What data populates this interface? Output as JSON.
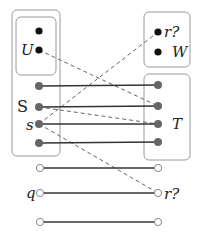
{
  "title": "",
  "colors": {
    "box_stroke": "#9a9a9a",
    "solid_edge": "#333333",
    "dashed_edge": "#666666",
    "black_node": "#111111",
    "gray_node": "#666666",
    "open_node_stroke": "#888888"
  },
  "boxes": [
    {
      "id": "outer-left",
      "x": 12,
      "y": 10,
      "w": 48,
      "h": 146
    },
    {
      "id": "U-box",
      "x": 16,
      "y": 17,
      "w": 40,
      "h": 58
    },
    {
      "id": "top-right",
      "x": 144,
      "y": 12,
      "w": 46,
      "h": 55
    },
    {
      "id": "T-box",
      "x": 144,
      "y": 74,
      "w": 46,
      "h": 86
    }
  ],
  "labels": {
    "U": "U",
    "S": "S",
    "s": "s",
    "T": "T",
    "r_top": "r?",
    "W": "W",
    "q": "q",
    "r_bottom": "r?"
  },
  "nodes": {
    "left": [
      {
        "id": "u1",
        "x": 39,
        "y": 31,
        "type": "black"
      },
      {
        "id": "U",
        "x": 39,
        "y": 50,
        "type": "black"
      },
      {
        "id": "l1",
        "x": 39,
        "y": 86,
        "type": "gray"
      },
      {
        "id": "S",
        "x": 39,
        "y": 107,
        "type": "gray"
      },
      {
        "id": "s",
        "x": 39,
        "y": 124,
        "type": "gray"
      },
      {
        "id": "l4",
        "x": 39,
        "y": 143,
        "type": "gray"
      },
      {
        "id": "o1",
        "x": 40,
        "y": 168,
        "type": "open"
      },
      {
        "id": "q",
        "x": 40,
        "y": 193,
        "type": "open"
      },
      {
        "id": "o3",
        "x": 40,
        "y": 222,
        "type": "open"
      }
    ],
    "right": [
      {
        "id": "r_top",
        "x": 158,
        "y": 32,
        "type": "black"
      },
      {
        "id": "W",
        "x": 158,
        "y": 52,
        "type": "black"
      },
      {
        "id": "t1",
        "x": 158,
        "y": 85,
        "type": "gray"
      },
      {
        "id": "t2",
        "x": 158,
        "y": 106,
        "type": "gray"
      },
      {
        "id": "t3",
        "x": 158,
        "y": 124,
        "type": "gray"
      },
      {
        "id": "t4",
        "x": 158,
        "y": 142,
        "type": "gray"
      },
      {
        "id": "p1",
        "x": 158,
        "y": 168,
        "type": "open"
      },
      {
        "id": "r_bottom",
        "x": 158,
        "y": 193,
        "type": "open"
      },
      {
        "id": "p3",
        "x": 158,
        "y": 222,
        "type": "open"
      }
    ]
  },
  "solid_edges": [
    [
      "l1",
      "t1"
    ],
    [
      "S",
      "t2"
    ],
    [
      "s",
      "t3"
    ],
    [
      "l4",
      "t4"
    ],
    [
      "o1",
      "p1"
    ],
    [
      "q",
      "r_bottom"
    ],
    [
      "o3",
      "p3"
    ]
  ],
  "dashed_edges": [
    [
      "U",
      "t2"
    ],
    [
      "s",
      "r_top"
    ],
    [
      "S",
      "t3"
    ],
    [
      "s",
      "r_bottom"
    ]
  ]
}
